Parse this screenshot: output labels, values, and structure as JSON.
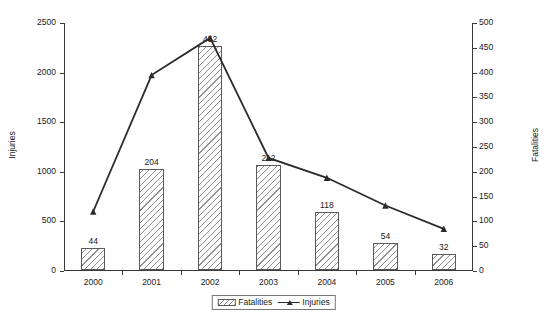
{
  "chart_data": {
    "type": "bar",
    "title": "",
    "xlabel": "",
    "categories": [
      "2000",
      "2001",
      "2002",
      "2003",
      "2004",
      "2005",
      "2006"
    ],
    "series": [
      {
        "name": "Fatalities",
        "type": "bar",
        "axis": "right",
        "values": [
          44,
          204,
          452,
          212,
          118,
          54,
          32
        ],
        "show_data_labels": true
      },
      {
        "name": "Injuries",
        "type": "line",
        "axis": "left",
        "values": [
          600,
          1975,
          2350,
          1140,
          940,
          660,
          425
        ],
        "show_data_labels": false
      }
    ],
    "axes": {
      "left": {
        "label": "Injuries",
        "ticks": [
          0,
          500,
          1000,
          1500,
          2000,
          2500
        ],
        "ylim": [
          0,
          2500
        ]
      },
      "right": {
        "label": "Fatalities",
        "ticks": [
          0,
          50,
          100,
          150,
          200,
          250,
          300,
          350,
          400,
          450,
          500
        ],
        "ylim": [
          0,
          500
        ]
      }
    },
    "grid": false,
    "legend": {
      "position": "bottom",
      "entries": [
        "Fatalities",
        "Injuries"
      ]
    },
    "colors": {
      "bar_edge": "#5a5a5a",
      "bar_hatch": "#8e8e8e",
      "line": "#2b2b2b",
      "axis": "#3a3a3a",
      "text": "#1a1a1a",
      "background": "#ffffff"
    }
  },
  "legend": {
    "fatalities_label": "Fatalities",
    "injuries_label": "Injuries"
  }
}
